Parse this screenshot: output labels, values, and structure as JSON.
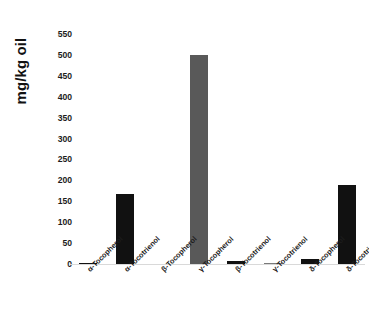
{
  "chart_data": {
    "type": "bar",
    "title": "",
    "subtitle": "",
    "xlabel": "",
    "ylabel": "mg/kg oil",
    "ylim": [
      0,
      550
    ],
    "yticks": [
      0,
      50,
      100,
      150,
      200,
      250,
      300,
      350,
      400,
      450,
      500,
      550
    ],
    "ytick_labels": [
      "0",
      "50",
      "100",
      "150",
      "200",
      "250",
      "300",
      "350",
      "400",
      "450",
      "500",
      "550"
    ],
    "grid": false,
    "legend": null,
    "legend_position": "none",
    "categories": [
      "α-Tocopherol",
      "α-Tocotrienol",
      "β-Tocopherol",
      "γ-Tocopherol",
      "β-Tocotrienol",
      "γ-Tocotrienol",
      "δ-Tocopherol",
      "δ-Tocotrienol"
    ],
    "values": [
      3,
      168,
      0,
      500,
      8,
      3,
      13,
      190
    ],
    "bar_colors": [
      "#111111",
      "#111111",
      "#111111",
      "#595959",
      "#111111",
      "#7a7a7a",
      "#111111",
      "#111111"
    ],
    "annotations": []
  },
  "colors": {
    "background": "#ffffff",
    "text": "#1c1c1c",
    "bar_black": "#111111",
    "bar_gray": "#595959",
    "baseline": "#d9d9d9"
  }
}
